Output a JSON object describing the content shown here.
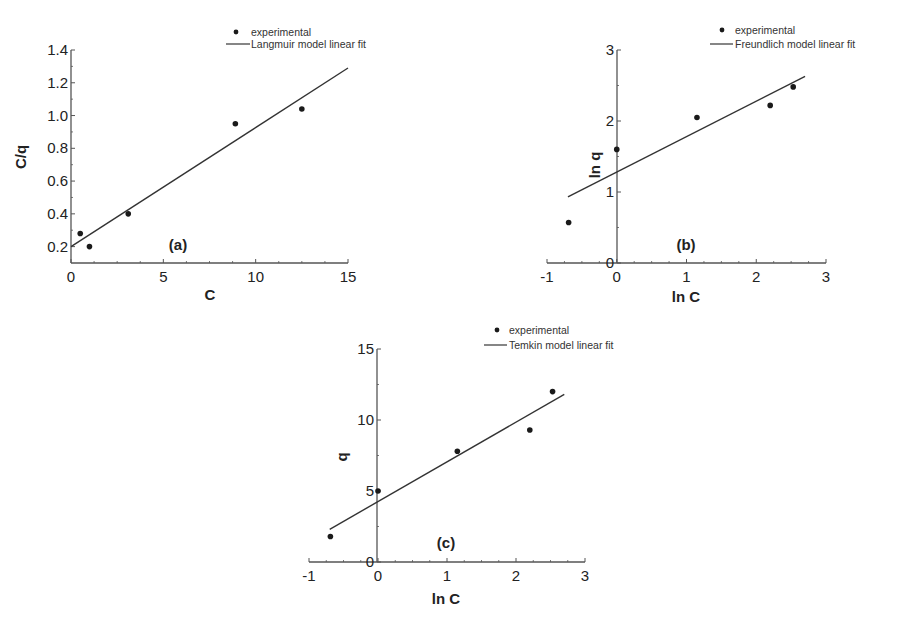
{
  "figure": {
    "panels": [
      {
        "id": "a",
        "label": "(a)"
      },
      {
        "id": "b",
        "label": "(b)"
      },
      {
        "id": "c",
        "label": "(c)"
      }
    ]
  },
  "chart_data": [
    {
      "type": "scatter",
      "panel": "(a)",
      "title": "",
      "xlabel": "C",
      "ylabel": "C/q",
      "xlim": [
        0,
        15
      ],
      "ylim": [
        0.1,
        1.4
      ],
      "xticks": [
        0,
        5,
        10,
        15
      ],
      "yticks": [
        0.2,
        0.4,
        0.6,
        0.8,
        1.0,
        1.2,
        1.4
      ],
      "ytick_labels": [
        "0.2",
        "0.4",
        "0.6",
        "0.8",
        "1.0",
        "1.2",
        "1.4"
      ],
      "grid": false,
      "legend_position": "top-right",
      "series": [
        {
          "name": "experimental",
          "kind": "points",
          "x": [
            0.5,
            1.0,
            3.1,
            8.9,
            12.5
          ],
          "y": [
            0.28,
            0.2,
            0.4,
            0.95,
            1.04
          ]
        },
        {
          "name": "Langmuir model linear fit",
          "kind": "line",
          "x": [
            0,
            15
          ],
          "y": [
            0.2,
            1.29
          ]
        }
      ]
    },
    {
      "type": "scatter",
      "panel": "(b)",
      "title": "",
      "xlabel": "ln C",
      "ylabel": "ln q",
      "xlim": [
        -1,
        3
      ],
      "ylim": [
        0,
        3
      ],
      "xticks": [
        -1,
        0,
        1,
        2,
        3
      ],
      "yticks": [
        0,
        1,
        2,
        3
      ],
      "ytick_labels": [
        "0",
        "1",
        "2",
        "3"
      ],
      "grid": false,
      "legend_position": "top-right",
      "series": [
        {
          "name": "experimental",
          "kind": "points",
          "x": [
            -0.69,
            0.0,
            1.15,
            2.2,
            2.53
          ],
          "y": [
            0.57,
            1.6,
            2.05,
            2.22,
            2.48
          ]
        },
        {
          "name": "Freundlich model linear fit",
          "kind": "line",
          "x": [
            -0.7,
            2.7
          ],
          "y": [
            0.93,
            2.63
          ]
        }
      ]
    },
    {
      "type": "scatter",
      "panel": "(c)",
      "title": "",
      "xlabel": "ln C",
      "ylabel": "q",
      "xlim": [
        -1,
        3
      ],
      "ylim": [
        0,
        15
      ],
      "xticks": [
        -1,
        0,
        1,
        2,
        3
      ],
      "yticks": [
        0,
        5,
        10,
        15
      ],
      "ytick_labels": [
        "0",
        "5",
        "10",
        "15"
      ],
      "grid": false,
      "legend_position": "top-right",
      "series": [
        {
          "name": "experimental",
          "kind": "points",
          "x": [
            -0.69,
            0.0,
            1.15,
            2.2,
            2.53
          ],
          "y": [
            1.8,
            5.0,
            7.8,
            9.3,
            12.0
          ]
        },
        {
          "name": "Temkin model linear fit",
          "kind": "line",
          "x": [
            -0.7,
            2.7
          ],
          "y": [
            2.3,
            11.8
          ]
        }
      ]
    }
  ],
  "layout": [
    {
      "x0": 71,
      "x1": 348,
      "y0": 263,
      "y1": 50,
      "yaxis_x": 71,
      "xaxis_y": 263,
      "ymin_at_axis": 0.1,
      "legend": {
        "dot_x": 236,
        "dot_y": 32,
        "line_x0": 226,
        "line_x1": 250,
        "line_y": 44,
        "text_x": 251
      },
      "panel_label_pos": [
        178,
        250
      ],
      "xlabel_pos": [
        210,
        300
      ],
      "ylabel_pos": [
        26,
        157
      ]
    },
    {
      "x0": 547,
      "x1": 826,
      "y0": 263,
      "y1": 50,
      "yaxis_x": 617,
      "xaxis_y": 263,
      "ymin_at_axis": 0,
      "legend": {
        "dot_x": 722,
        "dot_y": 30,
        "line_x0": 710,
        "line_x1": 733,
        "line_y": 44,
        "text_x": 735
      },
      "panel_label_pos": [
        686,
        250
      ],
      "xlabel_pos": [
        686,
        302
      ],
      "ylabel_pos": [
        600,
        165
      ]
    },
    {
      "x0": 309,
      "x1": 585,
      "y0": 562,
      "y1": 349,
      "yaxis_x": 377,
      "xaxis_y": 562,
      "ymin_at_axis": 0,
      "legend": {
        "dot_x": 497,
        "dot_y": 330,
        "line_x0": 484,
        "line_x1": 507,
        "line_y": 345,
        "text_x": 509
      },
      "panel_label_pos": [
        446,
        548
      ],
      "xlabel_pos": [
        446,
        604
      ],
      "ylabel_pos": [
        347,
        457
      ]
    }
  ]
}
